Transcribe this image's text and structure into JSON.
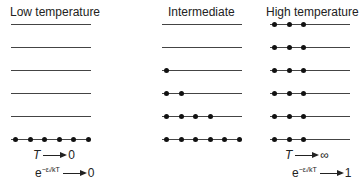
{
  "columns": [
    {
      "title": "Low temperature",
      "occupancy": [
        0,
        0,
        0,
        0,
        0,
        6
      ]
    },
    {
      "title": "Intermediate",
      "occupancy": [
        0,
        0,
        1,
        2,
        4,
        6
      ]
    },
    {
      "title": "High temperature",
      "occupancy": [
        3,
        3,
        3,
        3,
        3,
        3
      ]
    }
  ],
  "captions": {
    "low_T": "T",
    "low_T_val": "0",
    "low_e": "e",
    "low_e_exp": "−εᵢ/kT",
    "low_e_val": "0",
    "high_T": "T",
    "high_T_val": "∞",
    "high_e": "e",
    "high_e_exp": "−εᵢ/kT",
    "high_e_val": "1"
  }
}
